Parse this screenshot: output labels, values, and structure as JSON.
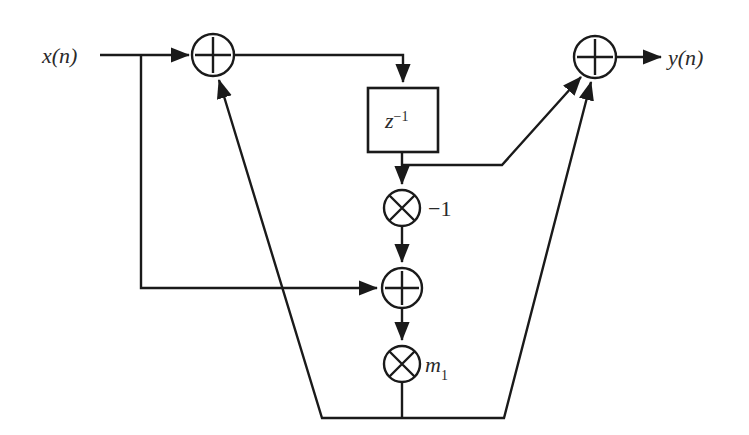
{
  "figure": {
    "kind": "signal-flow-graph",
    "title": "",
    "background_color": "#ffffff",
    "line_color": "#1a1a1a",
    "text_color": "#2a2a2a",
    "width": 749,
    "height": 435
  },
  "labels": {
    "input_signal": "x(n)",
    "output_signal": "y(n)",
    "delay_block": "z",
    "delay_block_exponent": "−1",
    "gain_negative_one": "−1",
    "gain_m1_base": "m",
    "gain_m1_subscript": "1"
  },
  "nodes": [
    {
      "id": "adder-input",
      "type": "adder",
      "glyph": "plus",
      "label": "",
      "cx": 213,
      "cy": 55,
      "r": 21
    },
    {
      "id": "delay-z-inverse",
      "type": "delay-block",
      "glyph": "box",
      "label": "z^-1",
      "x": 368,
      "y": 88,
      "w": 70,
      "h": 64
    },
    {
      "id": "multiplier-negative-one",
      "type": "multiplier",
      "glyph": "times",
      "label": "-1",
      "cx": 402,
      "cy": 208,
      "r": 18
    },
    {
      "id": "adder-middle",
      "type": "adder",
      "glyph": "plus",
      "label": "",
      "cx": 402,
      "cy": 288,
      "r": 20
    },
    {
      "id": "multiplier-m1",
      "type": "multiplier",
      "glyph": "times",
      "label": "m1",
      "cx": 402,
      "cy": 364,
      "r": 18
    },
    {
      "id": "adder-output",
      "type": "adder",
      "glyph": "plus",
      "label": "",
      "cx": 595,
      "cy": 57,
      "r": 21
    }
  ],
  "edges": [
    {
      "id": "edge-input-to-adder",
      "from": "x(n)",
      "to": "adder-input",
      "arrow": true
    },
    {
      "id": "edge-input-tap-down",
      "from": "input-tap",
      "to": "adder-middle",
      "arrow": true
    },
    {
      "id": "edge-adder-to-delay",
      "from": "adder-input",
      "to": "delay-z-inverse",
      "arrow": true
    },
    {
      "id": "edge-delay-to-multiplier",
      "from": "delay-z-inverse",
      "to": "multiplier-negative-one",
      "arrow": true
    },
    {
      "id": "edge-delay-tap-to-output-adder",
      "from": "delay-z-inverse",
      "to": "adder-output",
      "arrow": true
    },
    {
      "id": "edge-multiplier-to-adder-middle",
      "from": "multiplier-negative-one",
      "to": "adder-middle",
      "arrow": true
    },
    {
      "id": "edge-adder-middle-to-m1",
      "from": "adder-middle",
      "to": "multiplier-m1",
      "arrow": true
    },
    {
      "id": "edge-m1-feedback-to-adder-input",
      "from": "multiplier-m1",
      "to": "adder-input",
      "arrow": true
    },
    {
      "id": "edge-m1-to-output-adder",
      "from": "multiplier-m1",
      "to": "adder-output",
      "arrow": true
    },
    {
      "id": "edge-adder-output-to-y",
      "from": "adder-output",
      "to": "y(n)",
      "arrow": true
    }
  ]
}
